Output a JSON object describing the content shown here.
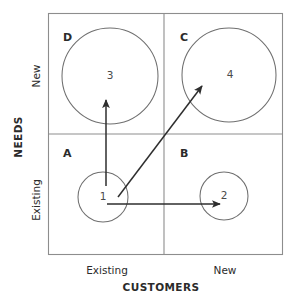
{
  "diagram": {
    "type": "2x2-matrix",
    "title_visible": false,
    "colors": {
      "frame_stroke": "#8d8d8d",
      "circle_stroke": "#6f6f6f",
      "arrow_stroke": "#2e2e2e",
      "text": "#2b2b2b",
      "background": "#ffffff"
    },
    "axes": {
      "x": {
        "title": "CUSTOMERS",
        "ticks": [
          {
            "label": "Existing"
          },
          {
            "label": "New"
          }
        ]
      },
      "y": {
        "title": "NEEDS",
        "ticks": [
          {
            "label": "Existing"
          },
          {
            "label": "New"
          }
        ]
      }
    },
    "quadrants": [
      {
        "letter": "D",
        "position": "top-left",
        "x_level": "Existing",
        "y_level": "New"
      },
      {
        "letter": "C",
        "position": "top-right",
        "x_level": "New",
        "y_level": "New"
      },
      {
        "letter": "A",
        "position": "bottom-left",
        "x_level": "Existing",
        "y_level": "Existing"
      },
      {
        "letter": "B",
        "position": "bottom-right",
        "x_level": "New",
        "y_level": "Existing"
      }
    ],
    "bubbles": [
      {
        "number": "1",
        "quadrant": "A",
        "size": "small"
      },
      {
        "number": "2",
        "quadrant": "B",
        "size": "small"
      },
      {
        "number": "3",
        "quadrant": "D",
        "size": "large"
      },
      {
        "number": "4",
        "quadrant": "C",
        "size": "large"
      }
    ],
    "arrows": [
      {
        "name": "arrow-1-to-3",
        "from": "1",
        "to": "3",
        "direction": "up"
      },
      {
        "name": "arrow-1-to-4",
        "from": "1",
        "to": "4",
        "direction": "diagonal-up-right"
      },
      {
        "name": "arrow-1-to-2",
        "from": "1",
        "to": "2",
        "direction": "right"
      }
    ]
  }
}
